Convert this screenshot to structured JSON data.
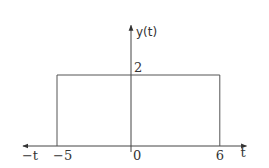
{
  "chart_data": {
    "type": "line",
    "title": "",
    "ylabel": "y(t)",
    "xlabel": "t",
    "x_negative_label": "−t",
    "xlim": [
      -7.3,
      7.8
    ],
    "ylim": [
      0,
      3.4
    ],
    "grid": false,
    "series": [
      {
        "name": "y(t)",
        "description": "rectangular pulse of height 2 from t = -5 to t = 6",
        "x": [
          -5,
          -5,
          6,
          6
        ],
        "y": [
          0,
          2,
          2,
          0
        ]
      }
    ],
    "x_ticks": [
      {
        "value": -5,
        "label": "−5"
      },
      {
        "value": 0,
        "label": "0"
      },
      {
        "value": 6,
        "label": "6"
      }
    ],
    "y_ticks": [
      {
        "value": 2,
        "label": "2"
      }
    ]
  }
}
